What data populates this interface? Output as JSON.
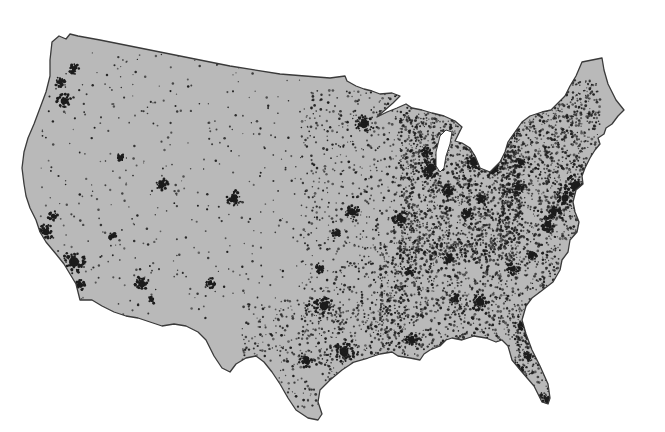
{
  "map": {
    "title": "Population distribution, contiguous United States",
    "type": "dot-density",
    "colors": {
      "background": "#ffffff",
      "land": "#b9b9b9",
      "outline": "#3a3a3a",
      "dots": "#1c1c1c",
      "lake": "#ffffff"
    },
    "outline": "M52,42 L59,36 L66,39 L70,34 L78,36 L100,40 L140,48 L180,56 L230,66 L280,74 L330,78 L345,76 L347,81 L356,86 L364,89 L372,91 L380,94 L392,93 L400,96 L393,103 L385,110 L377,117 L387,112 L397,108 L406,104 L412,108 L422,110 L432,113 L444,116 L455,121 L462,127 L459,133 L455,141 L462,143 L470,148 L475,156 L480,168 L490,172 L500,162 L505,152 L508,142 L515,132 L522,122 L530,116 L542,112 L551,110 L558,103 L565,96 L570,86 L576,76 L582,62 L592,60 L602,58 L604,70 L608,84 L616,100 L624,110 L618,116 L612,124 L606,128 L604,134 L598,138 L600,144 L595,150 L590,158 L585,168 L582,176 L583,184 L576,190 L573,202 L575,212 L579,222 L577,232 L570,240 L568,252 L562,260 L560,270 L553,282 L540,292 L532,298 L526,306 L522,320 L526,334 L532,350 L540,366 L548,384 L550,398 L548,404 L542,402 L534,386 L522,372 L512,360 L508,346 L502,340 L496,342 L486,338 L474,336 L462,340 L452,338 L446,340 L440,346 L430,350 L424,354 L420,360 L410,358 L398,356 L392,352 L380,354 L368,358 L354,362 L342,370 L330,380 L320,390 L318,402 L322,414 L318,420 L308,418 L296,410 L288,398 L280,384 L272,372 L264,362 L256,356 L246,358 L236,364 L230,372 L222,368 L214,356 L206,340 L198,332 L186,326 L174,324 L162,326 L150,322 L138,318 L126,316 L114,312 L102,306 L92,300 L80,300 L78,292 L76,284 L70,274 L64,264 L56,254 L46,242 L40,232 L36,220 L30,208 L26,196 L24,184 L22,168 L24,152 L28,138 L34,124 L40,108 L46,92 L50,76 L50,60 Z",
    "lake_michigan": "M440,136 L446,130 L452,132 L450,144 L446,156 L444,168 L440,172 L436,166 L436,152 Z",
    "dot_density": {
      "seed": 1234,
      "regions": [
        {
          "name": "west",
          "x": [
            40,
            300
          ],
          "y": [
            50,
            320
          ],
          "count": 420,
          "size": [
            0.6,
            1.3
          ]
        },
        {
          "name": "plains",
          "x": [
            300,
            420
          ],
          "y": [
            90,
            360
          ],
          "count": 900,
          "size": [
            0.6,
            1.4
          ]
        },
        {
          "name": "midwest",
          "x": [
            400,
            520
          ],
          "y": [
            110,
            260
          ],
          "count": 1700,
          "size": [
            0.6,
            1.5
          ]
        },
        {
          "name": "south",
          "x": [
            380,
            560
          ],
          "y": [
            240,
            350
          ],
          "count": 1300,
          "size": [
            0.6,
            1.5
          ]
        },
        {
          "name": "texas",
          "x": [
            240,
            390
          ],
          "y": [
            300,
            410
          ],
          "count": 600,
          "size": [
            0.6,
            1.4
          ]
        },
        {
          "name": "northeast",
          "x": [
            500,
            600
          ],
          "y": [
            80,
            240
          ],
          "count": 1400,
          "size": [
            0.6,
            1.5
          ]
        },
        {
          "name": "florida",
          "x": [
            515,
            550
          ],
          "y": [
            320,
            400
          ],
          "count": 260,
          "size": [
            0.6,
            1.4
          ]
        }
      ]
    },
    "clusters": [
      {
        "name": "Seattle",
        "x": 64,
        "y": 101,
        "r": 6
      },
      {
        "name": "Tacoma",
        "x": 74,
        "y": 69,
        "r": 4
      },
      {
        "name": "Portland",
        "x": 60,
        "y": 82,
        "r": 4
      },
      {
        "name": "San Francisco Bay",
        "x": 46,
        "y": 232,
        "r": 6
      },
      {
        "name": "Sacramento",
        "x": 53,
        "y": 216,
        "r": 4
      },
      {
        "name": "Los Angeles",
        "x": 74,
        "y": 262,
        "r": 9
      },
      {
        "name": "San Diego",
        "x": 80,
        "y": 285,
        "r": 4
      },
      {
        "name": "Las Vegas",
        "x": 112,
        "y": 236,
        "r": 3
      },
      {
        "name": "Phoenix",
        "x": 142,
        "y": 284,
        "r": 6
      },
      {
        "name": "Tucson",
        "x": 152,
        "y": 300,
        "r": 3
      },
      {
        "name": "Salt Lake City",
        "x": 162,
        "y": 185,
        "r": 5
      },
      {
        "name": "Boise",
        "x": 120,
        "y": 157,
        "r": 3
      },
      {
        "name": "Denver",
        "x": 234,
        "y": 198,
        "r": 6
      },
      {
        "name": "Albuquerque",
        "x": 210,
        "y": 283,
        "r": 4
      },
      {
        "name": "Minneapolis",
        "x": 364,
        "y": 124,
        "r": 7
      },
      {
        "name": "Kansas City",
        "x": 352,
        "y": 212,
        "r": 6
      },
      {
        "name": "Omaha",
        "x": 336,
        "y": 233,
        "r": 3
      },
      {
        "name": "Oklahoma City",
        "x": 320,
        "y": 268,
        "r": 4
      },
      {
        "name": "Dallas",
        "x": 324,
        "y": 306,
        "r": 8
      },
      {
        "name": "Houston",
        "x": 344,
        "y": 352,
        "r": 8
      },
      {
        "name": "San Antonio",
        "x": 306,
        "y": 361,
        "r": 5
      },
      {
        "name": "St. Louis",
        "x": 400,
        "y": 218,
        "r": 6
      },
      {
        "name": "Chicago",
        "x": 431,
        "y": 168,
        "r": 8
      },
      {
        "name": "Milwaukee",
        "x": 426,
        "y": 152,
        "r": 4
      },
      {
        "name": "Detroit",
        "x": 474,
        "y": 162,
        "r": 7
      },
      {
        "name": "Indianapolis",
        "x": 448,
        "y": 191,
        "r": 5
      },
      {
        "name": "Cincinnati",
        "x": 468,
        "y": 214,
        "r": 5
      },
      {
        "name": "Columbus",
        "x": 481,
        "y": 199,
        "r": 4
      },
      {
        "name": "Cleveland",
        "x": 494,
        "y": 170,
        "r": 5
      },
      {
        "name": "Pittsburgh",
        "x": 518,
        "y": 188,
        "r": 5
      },
      {
        "name": "Memphis",
        "x": 410,
        "y": 272,
        "r": 4
      },
      {
        "name": "Nashville",
        "x": 450,
        "y": 260,
        "r": 4
      },
      {
        "name": "Atlanta",
        "x": 480,
        "y": 302,
        "r": 7
      },
      {
        "name": "Birmingham",
        "x": 456,
        "y": 299,
        "r": 4
      },
      {
        "name": "New Orleans",
        "x": 412,
        "y": 340,
        "r": 5
      },
      {
        "name": "Charlotte",
        "x": 513,
        "y": 269,
        "r": 5
      },
      {
        "name": "Raleigh",
        "x": 532,
        "y": 255,
        "r": 4
      },
      {
        "name": "Washington",
        "x": 548,
        "y": 224,
        "r": 6
      },
      {
        "name": "Baltimore",
        "x": 554,
        "y": 212,
        "r": 5
      },
      {
        "name": "Philadelphia",
        "x": 565,
        "y": 198,
        "r": 6
      },
      {
        "name": "New York",
        "x": 576,
        "y": 186,
        "r": 9
      },
      {
        "name": "Boston",
        "x": 603,
        "y": 160,
        "r": 7
      },
      {
        "name": "Providence",
        "x": 595,
        "y": 172,
        "r": 4
      },
      {
        "name": "Hartford",
        "x": 588,
        "y": 176,
        "r": 4
      },
      {
        "name": "Buffalo",
        "x": 520,
        "y": 162,
        "r": 4
      },
      {
        "name": "Jacksonville",
        "x": 523,
        "y": 325,
        "r": 4
      },
      {
        "name": "Orlando",
        "x": 529,
        "y": 356,
        "r": 4
      },
      {
        "name": "Tampa",
        "x": 518,
        "y": 370,
        "r": 5
      },
      {
        "name": "Miami",
        "x": 548,
        "y": 400,
        "r": 6
      }
    ]
  }
}
